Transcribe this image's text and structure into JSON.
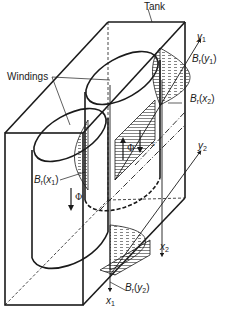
{
  "diagram": {
    "type": "technical-illustration",
    "colors": {
      "line": "#1a1a1a",
      "background": "#ffffff"
    },
    "labels": {
      "tank": "Tank",
      "windings": "Windings",
      "br_y1": {
        "main": "B",
        "sub_r": "r",
        "arg": "y",
        "arg_sub": "1"
      },
      "br_x2": {
        "main": "B",
        "sub_r": "r",
        "arg": "x",
        "arg_sub": "2"
      },
      "br_x1": {
        "main": "B",
        "sub_r": "r",
        "arg": "x",
        "arg_sub": "1"
      },
      "br_y2": {
        "main": "B",
        "sub_r": "r",
        "arg": "y",
        "arg_sub": "2"
      },
      "axis_y1": {
        "main": "y",
        "sub": "1"
      },
      "axis_y2": {
        "main": "y",
        "sub": "2"
      },
      "axis_x1": {
        "main": "x",
        "sub": "1"
      },
      "axis_x2": {
        "main": "x",
        "sub": "2"
      },
      "phi_up": "Φ",
      "phi_down": "Φ",
      "s": "s"
    }
  }
}
